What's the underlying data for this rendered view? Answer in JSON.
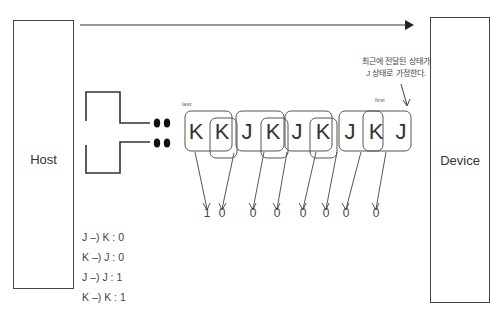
{
  "host": {
    "label": "Host"
  },
  "device": {
    "label": "Device"
  },
  "signal": {
    "last_label": "last",
    "first_label": "first",
    "letters": [
      "K",
      "K",
      "J",
      "K",
      "J",
      "K",
      "J",
      "K",
      "J"
    ],
    "outputs": [
      "1",
      "0",
      "0",
      "0",
      "0",
      "0",
      "0",
      "0"
    ]
  },
  "annotation": {
    "line1": "최근에 전달된 상태가",
    "line2": "J 상태로 가정한다."
  },
  "rules": [
    "J –) K : 0",
    "K –) J : 0",
    "J –) J : 1",
    "K –) K : 1"
  ],
  "colors": {
    "stroke": "#444444",
    "text": "#333333",
    "background": "#ffffff"
  }
}
